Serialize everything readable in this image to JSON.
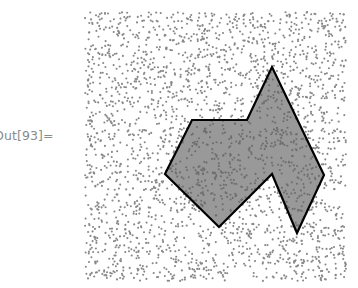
{
  "cell": {
    "output_label": "Out[93]="
  },
  "graphic": {
    "point_region": {
      "x_min": 85,
      "x_max": 346,
      "y_min": 12,
      "y_max": 281
    },
    "point_count": 2600,
    "point_color": "#888888",
    "point_radius": 1.05,
    "polygon": {
      "vertices": [
        [
          192,
          120
        ],
        [
          247,
          120
        ],
        [
          272,
          67
        ],
        [
          324,
          175
        ],
        [
          297,
          233
        ],
        [
          272,
          174
        ],
        [
          219,
          227
        ],
        [
          165,
          174
        ]
      ],
      "fill": "#999999",
      "stroke": "#000000",
      "stroke_width": 2.2
    },
    "inside_point_color": "#6e6e6e"
  }
}
